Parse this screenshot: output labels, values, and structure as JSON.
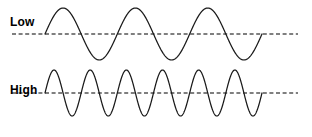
{
  "figure": {
    "title": "",
    "background_color": "#ffffff",
    "width": 312,
    "height": 137
  },
  "rows": [
    {
      "label": "Low",
      "name": "low-frequency-wave",
      "cycles": 3,
      "baseline_y": 34,
      "amplitude": 26,
      "wave_start_x": 45,
      "wave_end_x": 262,
      "axis_start_x": 12,
      "axis_end_x": 298,
      "stroke_color": "#1a1a1a",
      "axis_color": "#000000"
    },
    {
      "label": "High",
      "name": "high-frequency-wave",
      "cycles": 6,
      "baseline_y": 25,
      "amplitude": 23,
      "wave_start_x": 45,
      "wave_end_x": 262,
      "axis_start_x": 12,
      "axis_end_x": 298,
      "stroke_color": "#1a1a1a",
      "axis_color": "#000000"
    }
  ],
  "chart_data": {
    "type": "line",
    "title": "",
    "subtitle": "",
    "xlabel": "",
    "ylabel": "",
    "grid": false,
    "legend_position": "left-inline",
    "annotations": [
      "Low",
      "High"
    ],
    "series": [
      {
        "name": "Low",
        "waveform": "sine",
        "cycles": 3,
        "amplitude": 1.0,
        "phase": 0,
        "relative_frequency": 1,
        "x": [
          0,
          0.0833,
          0.1667,
          0.25,
          0.3333,
          0.4167,
          0.5,
          0.5833,
          0.6667,
          0.75,
          0.8333,
          0.9167,
          1.0
        ],
        "values": [
          0,
          0.707,
          1.0,
          0.707,
          0,
          -0.707,
          -1.0,
          -0.707,
          0,
          0.707,
          1.0,
          0.707,
          0
        ]
      },
      {
        "name": "High",
        "waveform": "sine",
        "cycles": 6,
        "amplitude": 1.0,
        "phase": 0,
        "relative_frequency": 2,
        "x": [
          0,
          0.0417,
          0.0833,
          0.125,
          0.1667,
          0.2083,
          0.25,
          0.2917,
          0.3333,
          0.375,
          0.4167,
          0.4583,
          0.5,
          0.5417,
          0.5833,
          0.625,
          0.6667,
          0.7083,
          0.75,
          0.7917,
          0.8333,
          0.875,
          0.9167,
          0.9583,
          1.0
        ],
        "values": [
          0,
          0.707,
          1.0,
          0.707,
          0,
          -0.707,
          -1.0,
          -0.707,
          0,
          0.707,
          1.0,
          0.707,
          0,
          -0.707,
          -1.0,
          -0.707,
          0,
          0.707,
          1.0,
          0.707,
          0,
          -0.707,
          -1.0,
          -0.707,
          0
        ]
      }
    ],
    "ylim": [
      -1.2,
      1.2
    ],
    "xlim": [
      0,
      1
    ]
  }
}
